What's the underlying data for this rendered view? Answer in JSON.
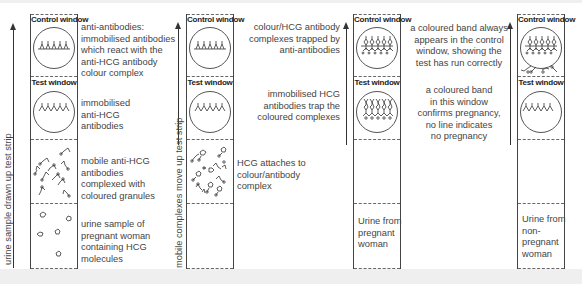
{
  "panels": [
    {
      "id": "strip1",
      "side_label": "urine sample drawn up test strip",
      "control_window_label": "Control window",
      "test_window_label": "Test window",
      "annotations": {
        "control": "anti-antibodies:\nimmobilised antibodies\nwhich react with the\nanti-HCG antibody\ncolour complex",
        "test": "immobilised\nanti-HCG\nantibodies",
        "mobile": "mobile anti-HCG\nantibodies\ncomplexed with\ncoloured granules",
        "urine": "urine sample of\npregnant woman\ncontaining HCG\nmolecules"
      }
    },
    {
      "id": "strip2",
      "side_label": "mobile complexes move up test strip",
      "control_window_label": "Control window",
      "test_window_label": "Test window",
      "annotations": {
        "mobile": "HCG attaches to\ncolour/antibody\ncomplex"
      }
    },
    {
      "id": "strip3",
      "control_window_label": "Control window",
      "test_window_label": "Test window",
      "inside_label": "Urine from\npregnant\nwoman",
      "annotations": {
        "control": "colour/HCG antibody\ncomplexes trapped by\nanti-antibodies",
        "test": "immobilised HCG\nantibodies trap the\ncoloured complexes"
      }
    },
    {
      "id": "strip4",
      "control_window_label": "Control window",
      "test_window_label": "Test window",
      "inside_label": "Urine from\nnon-\npregnant\nwoman"
    }
  ],
  "explanations": {
    "control": "a coloured band always\nappears in the control\nwindow, showing the\ntest has run correctly",
    "test": "a coloured band\nin this window\nconfirms pregnancy,\nno line indicates\nno pregnancy"
  },
  "colors": {
    "background": "#efefef",
    "panel": "#ffffff",
    "line": "#444444",
    "text": "#444444"
  }
}
